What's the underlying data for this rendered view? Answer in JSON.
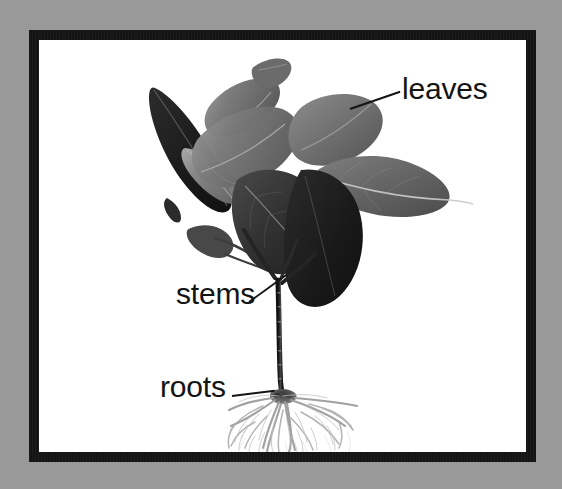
{
  "image": {
    "type": "photo-diagram",
    "subject": "young plant seedling with labeled parts",
    "background_color": "#999999",
    "frame_color": "#141414",
    "plate_color": "#ffffff",
    "label_color": "#141414"
  },
  "labels": [
    {
      "id": "leaves",
      "text": "leaves",
      "points_to": "upper foliage cluster",
      "leader_line": true
    },
    {
      "id": "stems",
      "text": "stems",
      "points_to": "vertical stalk and branch fork",
      "leader_line": true
    },
    {
      "id": "roots",
      "text": "roots",
      "points_to": "fibrous root mass at base",
      "leader_line": true
    }
  ],
  "plant": {
    "common_name": "rubber plant seedling",
    "parts": {
      "leaves_count": 8,
      "stem_description": "slender upright stalk with Y fork near top",
      "roots_description": "fine pale fibrous root system spreading outward"
    },
    "tones": {
      "leaf_darkest": "#1e1e1e",
      "leaf_dark": "#3a3a3a",
      "leaf_mid": "#6b6b6b",
      "leaf_light": "#8c8c8c",
      "leaf_highlight": "#b4b4b4",
      "stem": "#262626",
      "root": "#9a9a9a"
    }
  }
}
